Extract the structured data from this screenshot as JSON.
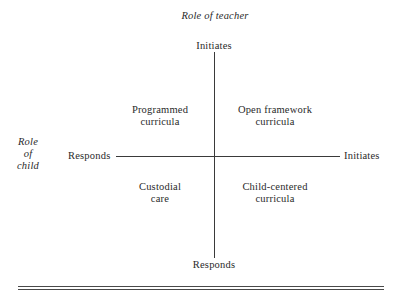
{
  "diagram": {
    "title_top": "Role of teacher",
    "title_left": [
      "Role",
      "of",
      "child"
    ],
    "axes": {
      "vertical": {
        "top": "Initiates",
        "bottom": "Responds"
      },
      "horizontal": {
        "left": "Responds",
        "right": "Initiates"
      }
    },
    "quadrants": {
      "top_left": [
        "Programmed",
        "curricula"
      ],
      "top_right": [
        "Open framework",
        "curricula"
      ],
      "bottom_left": [
        "Custodial",
        "care"
      ],
      "bottom_right": [
        "Child-centered",
        "curricula"
      ]
    }
  }
}
